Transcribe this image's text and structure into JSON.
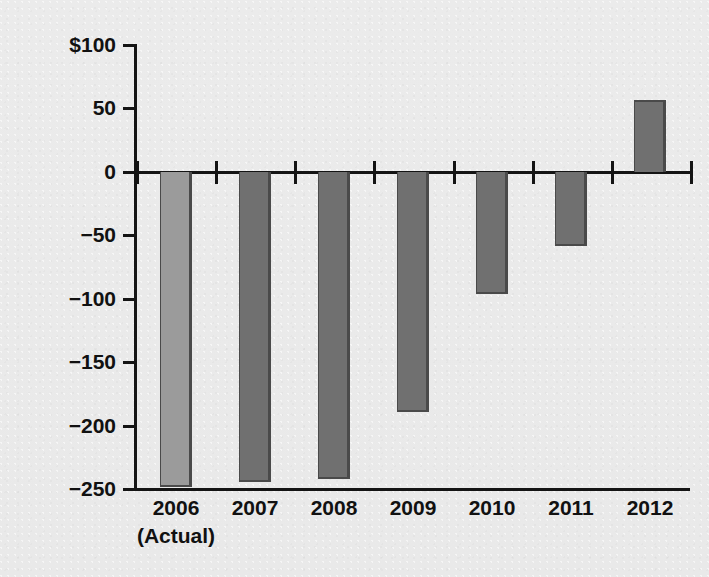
{
  "chart_data": {
    "type": "bar",
    "title": "",
    "subtitle": "",
    "xlabel": "",
    "ylabel": "In billions",
    "categories": [
      "2006",
      "2007",
      "2008",
      "2009",
      "2010",
      "2011",
      "2012"
    ],
    "category_sublabels": [
      "(Actual)",
      "",
      "",
      "",
      "",
      "",
      ""
    ],
    "values": [
      -248,
      -244,
      -242,
      -189,
      -96,
      -58,
      57
    ],
    "ylim": [
      -250,
      100
    ],
    "yticks": [
      100,
      50,
      0,
      -50,
      -100,
      -150,
      -200,
      -250
    ],
    "ytick_labels": [
      "$100",
      "50",
      "0",
      "−50",
      "−100",
      "−150",
      "−200",
      "−250"
    ],
    "grid": false,
    "legend": null,
    "bar_colors": [
      "#9b9b9b",
      "#707070",
      "#707070",
      "#707070",
      "#707070",
      "#707070",
      "#707070"
    ],
    "bar_edge_color": "#4a4a4a",
    "axis_color": "#141414",
    "background_color": "#ebebeb"
  }
}
